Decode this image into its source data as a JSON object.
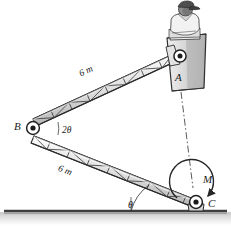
{
  "figure": {
    "labels": {
      "joint_b": "B",
      "joint_a": "A",
      "joint_c": "C",
      "moment": "M",
      "angle_theta": "θ",
      "angle_two_theta": "2θ",
      "length_upper": "6 m",
      "length_lower": "6 m"
    },
    "colors": {
      "line": "#262626",
      "truss_fill": "#e6e6e6",
      "truss_shade": "#bdbdbd",
      "bucket_fill": "#d2d2d2",
      "bucket_shade": "#a8a8a8",
      "ground": "#4a4a4a",
      "ground_band": "#cfcfcf",
      "worker_shirt": "#f0f0f0",
      "worker_skin": "#8f8f8f",
      "worker_cap": "#555555"
    },
    "geometry": {
      "pin_a": [
        180,
        56
      ],
      "pin_b": [
        32,
        128
      ],
      "pin_c": [
        196,
        204
      ],
      "ground_y": 211,
      "boom_length_m": 6
    },
    "elements": [
      "upper-boom-truss",
      "lower-boom-truss",
      "pin-joint-a",
      "pin-joint-b",
      "pin-joint-c",
      "worker-bucket",
      "worker-figure",
      "moment-arrow",
      "centerline",
      "angle-arc-theta",
      "ground-line"
    ]
  }
}
